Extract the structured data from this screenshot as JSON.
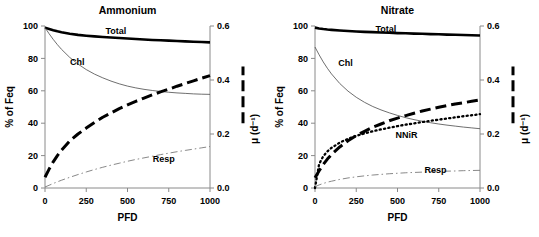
{
  "figure": {
    "panels": [
      "ammonium",
      "nitrate"
    ]
  },
  "chart_data": [
    {
      "type": "line",
      "panel_id": "ammonium",
      "title": "Ammonium",
      "xlabel": "PFD",
      "ylabel": "% of Feq",
      "y2label": "μ (d⁻¹)",
      "xlim": [
        0,
        1000
      ],
      "ylim": [
        0,
        100
      ],
      "y2lim": [
        0.0,
        0.6
      ],
      "xticks": [
        0,
        250,
        500,
        750,
        1000
      ],
      "yticks": [
        0,
        20,
        40,
        60,
        80,
        100
      ],
      "y2ticks": [
        0.0,
        0.2,
        0.4,
        0.6
      ],
      "grid": false,
      "legend_position": "inline-labels",
      "x": [
        0,
        25,
        50,
        75,
        100,
        150,
        200,
        250,
        300,
        350,
        400,
        450,
        500,
        550,
        600,
        650,
        700,
        750,
        800,
        850,
        900,
        950,
        1000
      ],
      "series": [
        {
          "name": "Total",
          "label": "Total",
          "axis": "left",
          "style": "solid-thick",
          "label_x": 430,
          "label_y": 97,
          "values": [
            99.0,
            98.2,
            97.4,
            96.7,
            96.1,
            95.2,
            94.5,
            94.0,
            93.6,
            93.2,
            92.9,
            92.6,
            92.3,
            92.0,
            91.7,
            91.4,
            91.2,
            91.0,
            90.7,
            90.5,
            90.3,
            90.1,
            89.9
          ]
        },
        {
          "name": "Chl",
          "label": "Chl",
          "axis": "left",
          "style": "solid-thin",
          "label_x": 195,
          "label_y": 78,
          "values": [
            99.0,
            95.2,
            91.7,
            88.5,
            85.6,
            80.6,
            76.5,
            73.1,
            70.3,
            68.0,
            66.0,
            64.3,
            62.9,
            61.8,
            60.9,
            60.2,
            59.6,
            59.1,
            58.7,
            58.4,
            58.1,
            57.9,
            57.8
          ]
        },
        {
          "name": "mu",
          "label": "",
          "axis": "right",
          "style": "dashed-thick",
          "label_x": 0,
          "label_y": 0,
          "values": [
            0.04,
            0.07,
            0.097,
            0.12,
            0.14,
            0.174,
            0.2,
            0.222,
            0.243,
            0.262,
            0.278,
            0.294,
            0.308,
            0.321,
            0.333,
            0.345,
            0.356,
            0.366,
            0.377,
            0.387,
            0.397,
            0.407,
            0.416
          ]
        },
        {
          "name": "Resp",
          "label": "Resp",
          "axis": "left",
          "style": "dashdot-thin",
          "label_x": 720,
          "label_y": 18,
          "values": [
            0.6,
            1.7,
            2.8,
            3.8,
            4.8,
            6.6,
            8.3,
            9.9,
            11.4,
            12.8,
            14.1,
            15.3,
            16.5,
            17.6,
            18.6,
            19.6,
            20.6,
            21.5,
            22.4,
            23.2,
            24.0,
            24.8,
            25.6
          ]
        }
      ],
      "legend_marker": {
        "style": "dashed-thick",
        "orientation": "vertical",
        "y2_from": 0.24,
        "y2_to": 0.45
      }
    },
    {
      "type": "line",
      "panel_id": "nitrate",
      "title": "Nitrate",
      "xlabel": "PFD",
      "ylabel": "% of Feq",
      "y2label": "μ (d⁻¹)",
      "xlim": [
        0,
        1000
      ],
      "ylim": [
        0,
        100
      ],
      "y2lim": [
        0.0,
        0.6
      ],
      "xticks": [
        0,
        250,
        500,
        750,
        1000
      ],
      "yticks": [
        0,
        20,
        40,
        60,
        80,
        100
      ],
      "y2ticks": [
        0.0,
        0.2,
        0.4,
        0.6
      ],
      "grid": false,
      "legend_position": "inline-labels",
      "x": [
        0,
        25,
        50,
        75,
        100,
        150,
        200,
        250,
        300,
        350,
        400,
        450,
        500,
        550,
        600,
        650,
        700,
        750,
        800,
        850,
        900,
        950,
        1000
      ],
      "series": [
        {
          "name": "Total",
          "label": "Total",
          "axis": "left",
          "style": "solid-thick",
          "label_x": 430,
          "label_y": 98,
          "values": [
            99.0,
            98.5,
            98.1,
            97.8,
            97.6,
            97.2,
            96.9,
            96.6,
            96.4,
            96.2,
            96.0,
            95.8,
            95.6,
            95.5,
            95.3,
            95.2,
            95.0,
            94.9,
            94.7,
            94.6,
            94.4,
            94.3,
            94.1
          ]
        },
        {
          "name": "Chl",
          "label": "Chl",
          "axis": "left",
          "style": "solid-thin",
          "label_x": 185,
          "label_y": 77,
          "values": [
            87.0,
            82.2,
            77.8,
            73.9,
            70.4,
            64.5,
            59.8,
            56.0,
            52.9,
            50.3,
            48.2,
            46.4,
            44.8,
            43.4,
            42.2,
            41.2,
            40.3,
            39.5,
            38.8,
            38.2,
            37.6,
            37.1,
            36.6
          ]
        },
        {
          "name": "mu",
          "label": "",
          "axis": "right",
          "style": "dashed-thick",
          "label_x": 0,
          "label_y": 0,
          "values": [
            0.038,
            0.064,
            0.087,
            0.107,
            0.124,
            0.152,
            0.175,
            0.194,
            0.21,
            0.225,
            0.237,
            0.249,
            0.259,
            0.268,
            0.277,
            0.285,
            0.292,
            0.299,
            0.305,
            0.311,
            0.316,
            0.321,
            0.326
          ]
        },
        {
          "name": "NNiR",
          "label": "NNiR",
          "axis": "left",
          "style": "dotted-thick",
          "label_x": 555,
          "label_y": 33,
          "values": [
            0.0,
            14.8,
            19.6,
            22.6,
            24.8,
            28.0,
            30.4,
            32.2,
            33.7,
            35.0,
            36.2,
            37.2,
            38.2,
            39.1,
            39.9,
            40.7,
            41.5,
            42.2,
            42.9,
            43.6,
            44.3,
            44.9,
            45.6
          ]
        },
        {
          "name": "Resp",
          "label": "Resp",
          "axis": "left",
          "style": "dashdot-thin",
          "label_x": 730,
          "label_y": 11,
          "values": [
            0.8,
            1.9,
            2.8,
            3.6,
            4.2,
            5.3,
            6.2,
            6.9,
            7.5,
            8.0,
            8.4,
            8.8,
            9.1,
            9.4,
            9.6,
            9.8,
            10.0,
            10.2,
            10.4,
            10.5,
            10.7,
            10.8,
            10.9
          ]
        }
      ],
      "legend_marker": {
        "style": "dashed-thick",
        "orientation": "vertical",
        "y2_from": 0.24,
        "y2_to": 0.45
      }
    }
  ]
}
